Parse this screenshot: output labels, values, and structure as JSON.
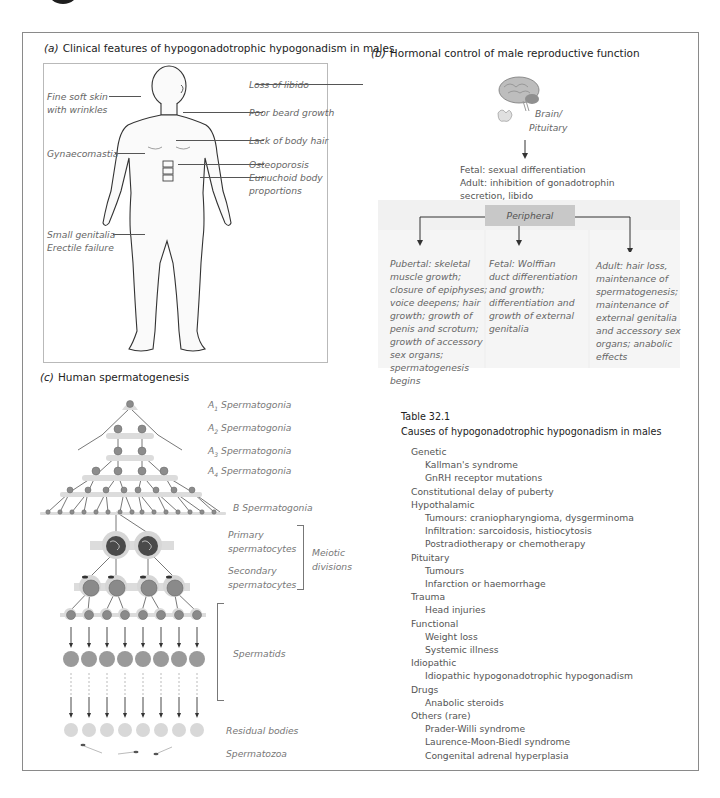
{
  "panel_a": {
    "title_label": "(a)",
    "title": "Clinical features of hypogonadotrophic hypogonadism in males",
    "labels_left": [
      "Fine soft skin",
      "with wrinkles",
      "Gynaecomastia",
      "Small genitalia",
      "Erectile failure"
    ],
    "labels_right": [
      "Loss of libido",
      "Poor beard growth",
      "Lack of body hair",
      "Osteoporosis",
      "Eunuchoid body",
      "proportions"
    ]
  },
  "panel_b": {
    "title_label": "(b)",
    "title": "Hormonal control of male reproductive function",
    "brain_label": [
      "Brain/",
      "Pituitary"
    ],
    "central_effects": [
      "Fetal: sexual differentiation",
      "Adult: inhibition of gonadotrophin",
      "secretion, libido"
    ],
    "peripheral_label": "Peripheral",
    "columns": [
      [
        "Pubertal: skeletal",
        "muscle growth;",
        "closure of epiphyses;",
        "voice deepens; hair",
        "growth; growth of",
        "penis and scrotum;",
        "growth of accessory",
        "sex organs;",
        "spermatogenesis",
        "begins"
      ],
      [
        "Fetal: Wolffian",
        "duct differentiation",
        "and growth;",
        "differentiation and",
        "growth of external",
        "genitalia"
      ],
      [
        "Adult: hair loss,",
        "maintenance of",
        "spermatogenesis;",
        "maintenance of",
        "external genitalia",
        "and accessory sex",
        "organs; anabolic",
        "effects"
      ]
    ]
  },
  "panel_c": {
    "title_label": "(c)",
    "title": "Human spermatogenesis",
    "stages": {
      "a1": {
        "prefix": "A",
        "sub": "1",
        "label": "Spermatogonia"
      },
      "a2": {
        "prefix": "A",
        "sub": "2",
        "label": "Spermatogonia"
      },
      "a3": {
        "prefix": "A",
        "sub": "3",
        "label": "Spermatogonia"
      },
      "a4": {
        "prefix": "A",
        "sub": "4",
        "label": "Spermatogonia"
      },
      "b": "B Spermatogonia",
      "primary": [
        "Primary",
        "spermatocytes"
      ],
      "secondary": [
        "Secondary",
        "spermatocytes"
      ],
      "meiotic": [
        "Meiotic",
        "divisions"
      ],
      "spermatids": "Spermatids",
      "residual": "Residual bodies",
      "spermatozoa": "Spermatozoa"
    }
  },
  "table": {
    "number": "Table 32.1",
    "title": "Causes of hypogonadotrophic hypogonadism in males",
    "rows": [
      {
        "level": 0,
        "text": "Genetic"
      },
      {
        "level": 1,
        "text": "Kallman's syndrome"
      },
      {
        "level": 1,
        "text": "GnRH receptor mutations"
      },
      {
        "level": 0,
        "text": "Constitutional delay of puberty"
      },
      {
        "level": 0,
        "text": "Hypothalamic"
      },
      {
        "level": 1,
        "text": "Tumours: craniopharyngioma, dysgerminoma"
      },
      {
        "level": 1,
        "text": "Infiltration: sarcoidosis, histiocytosis"
      },
      {
        "level": 1,
        "text": "Postradiotherapy or chemotherapy"
      },
      {
        "level": 0,
        "text": "Pituitary"
      },
      {
        "level": 1,
        "text": "Tumours"
      },
      {
        "level": 1,
        "text": "Infarction or haemorrhage"
      },
      {
        "level": 0,
        "text": "Trauma"
      },
      {
        "level": 1,
        "text": "Head injuries"
      },
      {
        "level": 0,
        "text": "Functional"
      },
      {
        "level": 1,
        "text": "Weight loss"
      },
      {
        "level": 1,
        "text": "Systemic illness"
      },
      {
        "level": 0,
        "text": "Idiopathic"
      },
      {
        "level": 1,
        "text": "Idiopathic hypogonadotrophic hypogonadism"
      },
      {
        "level": 0,
        "text": "Drugs"
      },
      {
        "level": 1,
        "text": "Anabolic steroids"
      },
      {
        "level": 0,
        "text": "Others (rare)"
      },
      {
        "level": 1,
        "text": "Prader-Willi syndrome"
      },
      {
        "level": 1,
        "text": "Laurence-Moon-Biedl syndrome"
      },
      {
        "level": 1,
        "text": "Congenital adrenal hyperplasia"
      }
    ]
  },
  "colors": {
    "frame": "#8a8a8a",
    "peripheral_box": "#c8c8c8",
    "panel_bg": "#f1f1f1",
    "cell_light": "#d9d9d9",
    "nucleus": "#8c8c8c",
    "text_grey": "#666666"
  }
}
